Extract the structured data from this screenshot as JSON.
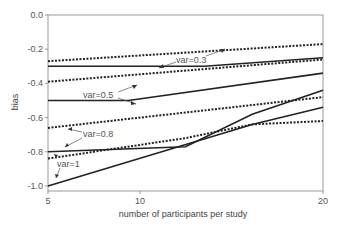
{
  "chart_data": {
    "type": "line",
    "title": "",
    "xlabel": "number of participants per study",
    "ylabel": "bias",
    "xscale": "log",
    "xlim": [
      5,
      20
    ],
    "ylim": [
      -1.05,
      0.0
    ],
    "xticks": [
      5,
      10,
      20
    ],
    "xtick_labels": [
      "5",
      "10",
      "20"
    ],
    "yticks": [
      0.0,
      -0.2,
      -0.4,
      -0.6,
      -0.8,
      -1.0
    ],
    "ytick_labels": [
      "0.0",
      "-0.2",
      "-0.4",
      "-0.6",
      "-0.8",
      "-1.0"
    ],
    "grid": false,
    "legend": "none (inline annotations with arrows)",
    "series": [
      {
        "name": "var=0.3 (solid)",
        "style": "solid",
        "x": [
          5,
          11,
          20
        ],
        "values": [
          -0.3,
          -0.3,
          -0.25
        ]
      },
      {
        "name": "var=0.3 (dotted)",
        "style": "dotted",
        "x": [
          5,
          20
        ],
        "values": [
          -0.27,
          -0.17
        ]
      },
      {
        "name": "var=0.5 (solid)",
        "style": "solid",
        "x": [
          5,
          7.5,
          20
        ],
        "values": [
          -0.5,
          -0.5,
          -0.34
        ]
      },
      {
        "name": "var=0.5 (dotted)",
        "style": "dotted",
        "x": [
          5,
          20
        ],
        "values": [
          -0.39,
          -0.26
        ]
      },
      {
        "name": "var=0.8 (solid)",
        "style": "solid",
        "x": [
          5,
          10,
          14,
          20
        ],
        "values": [
          -0.8,
          -0.77,
          -0.58,
          -0.44
        ]
      },
      {
        "name": "var=0.8 (dotted)",
        "style": "dotted",
        "x": [
          5,
          20
        ],
        "values": [
          -0.66,
          -0.48
        ]
      },
      {
        "name": "var=1 (solid)",
        "style": "solid",
        "x": [
          5,
          14,
          20
        ],
        "values": [
          -1.0,
          -0.64,
          -0.54
        ]
      },
      {
        "name": "var=1 (dotted)",
        "style": "dotted",
        "x": [
          5,
          10,
          14,
          20
        ],
        "values": [
          -0.84,
          -0.72,
          -0.64,
          -0.62
        ]
      }
    ],
    "annotations": [
      {
        "text": "var=0.3",
        "x": 11.5,
        "y": -0.24
      },
      {
        "text": "var=0.5",
        "x": 6.7,
        "y": -0.45
      },
      {
        "text": "var=0.8",
        "x": 6.6,
        "y": -0.69
      },
      {
        "text": "var=1",
        "x": 5.4,
        "y": -0.87
      }
    ]
  },
  "labels": {
    "xlabel": "number of participants per study",
    "ylabel": "bias",
    "ann_03": "var=0.3",
    "ann_05": "var=0.5",
    "ann_08": "var=0.8",
    "ann_1": "var=1"
  },
  "ticks": {
    "y": [
      "0.0",
      "-0.2",
      "-0.4",
      "-0.6",
      "-0.8",
      "-1.0"
    ],
    "x": [
      "5",
      "10",
      "20"
    ]
  }
}
